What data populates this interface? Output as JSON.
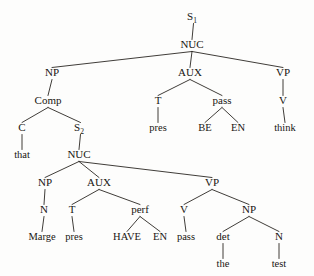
{
  "figure": {
    "kind": "syntax-tree-diagram",
    "sentence": "Marge has been passed the test, that pres BE EN think",
    "background_color": "#fdfdfc",
    "ink_color": "#181512",
    "edge_color": "#2a2722"
  },
  "nodes": [
    {
      "id": "s1",
      "label": "S",
      "sub": "1",
      "x": 192,
      "y": 20,
      "kind": "nonterminal"
    },
    {
      "id": "nuc1",
      "label": "NUC",
      "sub": "",
      "x": 192,
      "y": 48,
      "kind": "nonterminal"
    },
    {
      "id": "np1",
      "label": "NP",
      "sub": "",
      "x": 52,
      "y": 76,
      "kind": "nonterminal"
    },
    {
      "id": "aux1",
      "label": "AUX",
      "sub": "",
      "x": 190,
      "y": 76,
      "kind": "nonterminal"
    },
    {
      "id": "vp1",
      "label": "VP",
      "sub": "",
      "x": 283,
      "y": 76,
      "kind": "nonterminal"
    },
    {
      "id": "comp",
      "label": "Comp",
      "sub": "",
      "x": 48,
      "y": 104,
      "kind": "nonterminal"
    },
    {
      "id": "t1",
      "label": "T",
      "sub": "",
      "x": 158,
      "y": 104,
      "kind": "nonterminal"
    },
    {
      "id": "pass1",
      "label": "pass",
      "sub": "",
      "x": 222,
      "y": 104,
      "kind": "nonterminal"
    },
    {
      "id": "v1",
      "label": "V",
      "sub": "",
      "x": 283,
      "y": 104,
      "kind": "nonterminal"
    },
    {
      "id": "c",
      "label": "C",
      "sub": "",
      "x": 22,
      "y": 131,
      "kind": "nonterminal"
    },
    {
      "id": "s2",
      "label": "S",
      "sub": "2",
      "x": 79,
      "y": 131,
      "kind": "nonterminal"
    },
    {
      "id": "pres1",
      "label": "pres",
      "sub": "",
      "x": 158,
      "y": 131,
      "kind": "terminal"
    },
    {
      "id": "be",
      "label": "BE",
      "sub": "",
      "x": 205,
      "y": 131,
      "kind": "terminal"
    },
    {
      "id": "en1",
      "label": "EN",
      "sub": "",
      "x": 238,
      "y": 131,
      "kind": "terminal"
    },
    {
      "id": "think",
      "label": "think",
      "sub": "",
      "x": 285,
      "y": 131,
      "kind": "terminal"
    },
    {
      "id": "that",
      "label": "that",
      "sub": "",
      "x": 22,
      "y": 158,
      "kind": "terminal"
    },
    {
      "id": "nuc2",
      "label": "NUC",
      "sub": "",
      "x": 79,
      "y": 158,
      "kind": "nonterminal"
    },
    {
      "id": "np2",
      "label": "NP",
      "sub": "",
      "x": 45,
      "y": 186,
      "kind": "nonterminal"
    },
    {
      "id": "aux2",
      "label": "AUX",
      "sub": "",
      "x": 99,
      "y": 186,
      "kind": "nonterminal"
    },
    {
      "id": "vp2",
      "label": "VP",
      "sub": "",
      "x": 212,
      "y": 186,
      "kind": "nonterminal"
    },
    {
      "id": "n1",
      "label": "N",
      "sub": "",
      "x": 44,
      "y": 213,
      "kind": "nonterminal"
    },
    {
      "id": "t2",
      "label": "T",
      "sub": "",
      "x": 72,
      "y": 213,
      "kind": "nonterminal"
    },
    {
      "id": "perf",
      "label": "perf",
      "sub": "",
      "x": 140,
      "y": 213,
      "kind": "nonterminal"
    },
    {
      "id": "v2",
      "label": "V",
      "sub": "",
      "x": 184,
      "y": 213,
      "kind": "nonterminal"
    },
    {
      "id": "np3",
      "label": "NP",
      "sub": "",
      "x": 249,
      "y": 213,
      "kind": "nonterminal"
    },
    {
      "id": "marge",
      "label": "Marge",
      "sub": "",
      "x": 42,
      "y": 240,
      "kind": "terminal"
    },
    {
      "id": "pres2",
      "label": "pres",
      "sub": "",
      "x": 74,
      "y": 240,
      "kind": "terminal"
    },
    {
      "id": "have",
      "label": "HAVE",
      "sub": "",
      "x": 127,
      "y": 240,
      "kind": "terminal"
    },
    {
      "id": "en2",
      "label": "EN",
      "sub": "",
      "x": 160,
      "y": 240,
      "kind": "terminal"
    },
    {
      "id": "pass2",
      "label": "pass",
      "sub": "",
      "x": 186,
      "y": 240,
      "kind": "terminal"
    },
    {
      "id": "det",
      "label": "det",
      "sub": "",
      "x": 223,
      "y": 240,
      "kind": "nonterminal"
    },
    {
      "id": "n2",
      "label": "N",
      "sub": "",
      "x": 279,
      "y": 240,
      "kind": "nonterminal"
    },
    {
      "id": "the",
      "label": "the",
      "sub": "",
      "x": 223,
      "y": 267,
      "kind": "terminal"
    },
    {
      "id": "test",
      "label": "test",
      "sub": "",
      "x": 279,
      "y": 267,
      "kind": "terminal"
    }
  ],
  "edges": [
    {
      "from": "s1",
      "to": "nuc1"
    },
    {
      "from": "nuc1",
      "to": "np1"
    },
    {
      "from": "nuc1",
      "to": "aux1"
    },
    {
      "from": "nuc1",
      "to": "vp1"
    },
    {
      "from": "np1",
      "to": "comp"
    },
    {
      "from": "comp",
      "to": "c"
    },
    {
      "from": "comp",
      "to": "s2"
    },
    {
      "from": "c",
      "to": "that"
    },
    {
      "from": "aux1",
      "to": "t1"
    },
    {
      "from": "aux1",
      "to": "pass1"
    },
    {
      "from": "t1",
      "to": "pres1"
    },
    {
      "from": "pass1",
      "to": "be"
    },
    {
      "from": "pass1",
      "to": "en1"
    },
    {
      "from": "vp1",
      "to": "v1"
    },
    {
      "from": "v1",
      "to": "think"
    },
    {
      "from": "s2",
      "to": "nuc2"
    },
    {
      "from": "nuc2",
      "to": "np2"
    },
    {
      "from": "nuc2",
      "to": "aux2"
    },
    {
      "from": "nuc2",
      "to": "vp2"
    },
    {
      "from": "np2",
      "to": "n1"
    },
    {
      "from": "n1",
      "to": "marge"
    },
    {
      "from": "aux2",
      "to": "t2"
    },
    {
      "from": "aux2",
      "to": "perf"
    },
    {
      "from": "t2",
      "to": "pres2"
    },
    {
      "from": "perf",
      "to": "have"
    },
    {
      "from": "perf",
      "to": "en2"
    },
    {
      "from": "vp2",
      "to": "v2"
    },
    {
      "from": "vp2",
      "to": "np3"
    },
    {
      "from": "v2",
      "to": "pass2"
    },
    {
      "from": "np3",
      "to": "det"
    },
    {
      "from": "np3",
      "to": "n2"
    },
    {
      "from": "det",
      "to": "the"
    },
    {
      "from": "n2",
      "to": "test"
    }
  ]
}
